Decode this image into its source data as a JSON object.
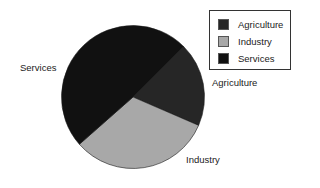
{
  "chart_data": {
    "type": "pie",
    "title": "",
    "categories": [
      "Agriculture",
      "Industry",
      "Services"
    ],
    "values": [
      19,
      32,
      49
    ],
    "unit": "%",
    "colors": [
      "#262626",
      "#a8a8a8",
      "#111111"
    ],
    "start_angle_deg_clockwise_from_top": 45,
    "direction": "clockwise",
    "slice_labels": [
      {
        "text": "Agriculture",
        "x": 212,
        "y": 78
      },
      {
        "text": "Industry",
        "x": 186,
        "y": 155
      },
      {
        "text": "Services",
        "x": 20,
        "y": 63
      }
    ],
    "legend": {
      "position": "top-right",
      "entries": [
        "Agriculture",
        "Industry",
        "Services"
      ]
    },
    "geometry": {
      "cx": 133,
      "cy": 97,
      "r": 71.5
    }
  }
}
